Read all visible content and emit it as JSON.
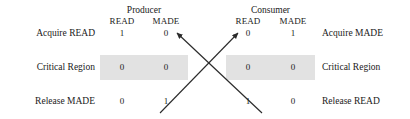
{
  "figure": {
    "groups": [
      {
        "name": "producer",
        "title": "Producer",
        "columns": [
          "READ",
          "MADE"
        ]
      },
      {
        "name": "consumer",
        "title": "Consumer",
        "columns": [
          "READ",
          "MADE"
        ]
      }
    ],
    "rows": [
      {
        "left_label": "Acquire READ",
        "right_label": "Acquire MADE",
        "producer": [
          "1",
          "0"
        ],
        "consumer": [
          "0",
          "1"
        ],
        "highlighted": false
      },
      {
        "left_label": "Critical Region",
        "right_label": "Critical Region",
        "producer": [
          "0",
          "0"
        ],
        "consumer": [
          "0",
          "0"
        ],
        "highlighted": true
      },
      {
        "left_label": "Release MADE",
        "right_label": "Release READ",
        "producer": [
          "0",
          "1"
        ],
        "consumer": [
          "1",
          "0"
        ],
        "highlighted": false
      }
    ],
    "arrows": [
      {
        "name": "release-read-to-acquire-read-made",
        "from": {
          "x": 262,
          "y": 113
        },
        "to": {
          "x": 177,
          "y": 33
        }
      },
      {
        "name": "release-made-to-acquire-made-read",
        "from": {
          "x": 160,
          "y": 113
        },
        "to": {
          "x": 238,
          "y": 33
        }
      }
    ],
    "colors": {
      "highlight_band": "#e2e2e2",
      "text": "#1a1a1a",
      "arrow": "#2b2b2b",
      "background": "#ffffff"
    }
  }
}
